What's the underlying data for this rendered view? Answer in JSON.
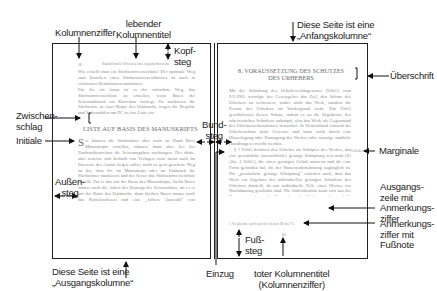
{
  "labels": {
    "kolumnenziffer": "Kolumnenziffer",
    "lebender_kolumnentitel": [
      "lebender",
      "Kolumnentitel"
    ],
    "kopfsteg": [
      "Kopf-",
      "steg"
    ],
    "anfangskolumne": [
      "Diese Seite ist eine",
      "„Anfangskolumne“"
    ],
    "ueberschrift": "Überschrift",
    "zwischenschlag": [
      "Zwischen-",
      "schlag"
    ],
    "initiale": "Initiale",
    "bundsteg": [
      "Bund-",
      "steg"
    ],
    "marginalie": "Marginale",
    "aussensteg": [
      "Außen-",
      "steg"
    ],
    "ausgangszeile": [
      "Ausgangs-",
      "zeile mit",
      "Anmerkungs-",
      "ziffer"
    ],
    "anmerkungsziffer": [
      "Anmerkungs-",
      "ziffer mit",
      "Fußnote"
    ],
    "fusssteg": [
      "Fuß-",
      "steg"
    ],
    "ausgangskolumne": [
      "Diese Seite ist eine",
      "„Ausgangskolumne“"
    ],
    "einzug": "Einzug",
    "toter_kolumnentitel": [
      "toter Kolumnentitel",
      "(Kolumnenziffer)"
    ]
  },
  "left_page": {
    "page_number": "56",
    "running_head": "Redaktionelle Hinweise und Aufgabenbereiche",
    "paragraph1": "Wie erstellt man ein Stichwortverzeichnis? Der optimale Weg zum Erstellen eines Stichwortverzeichnisses ist auch in erfahrenen Redaktionen umstritten.",
    "paragraph2": "Für Sie als Autor ist es der einfachste Weg, das Stichwortverzeichnis zu erstellen, wenn Ihnen der Seitenumbruch zur Korrektur vorliegt. Sie markieren die Stichworte in einer Kopie des Umbruchs, tragen die Begriffe und Seitenzahlen am PC in eine Liste ein.",
    "subheading": "LISTE AUF BASIS DES MANUSKRIPTS",
    "initial": "S",
    "paragraph3": "ie können die Stichwörter aber auch an Hand Ihres Manuskripts erstellen, müssen dann aber bei der Umbruchkorrektur die Seitenangaben nachtragen. Der dritte, aber teuerste und deshalb von Verlagen zwar meist auch im Interesse des Autors liegen sollte) nicht so gern gesehene Weg ist der, dass Sie im Manuskript oder im Umbruch die Stichwörter markieren und der Setzer das Stichwortverzeichnis erstellt. Tut er das auf der Basis des Manuskripts, bleibt Ihnen immer noch die Arbeit des Eintrags der Seitenzahlen, tut er es auf der Basis des Umbruchs, dann bleiben Ihnen immer noch das Korrekturlesen und eine „sichere Auswahl“ von Stichproben."
  },
  "right_page": {
    "heading": "8. VORAUSSETZUNG DES SCHUTZES DES URHEBERS",
    "paragraph1": "Mit der Schaffung des Urheberrechtsgesetzes (UrhG) vom 9.9.1965 verfolgte der Gesetzgeber das Ziel, den Schutz des Urhebers zu verbessern, wobei nicht das Werk, sondern die Person des Urhebers im Vordergrund steht. Das UrhG gewährleistet diesen Schutz, indem es an die Ergebnisse des urheberischen Schaffens anknüpft, also das Werk als Gegenstand des Urheberrechtsschutzes betrachtet. In Deutschland entsteht der Urheberschutz kraft Gesetzes und kann nicht durch eine Hinterlegung oder Eintragung des Werkes oder sonstige amtliche Handlungen erreicht werden.",
    "paragraph2": "§ 7 UrhG definiert den Urheber als Schöpfer des Werkes, das eine persönliche (menschliche) geistige Schöpfung sein muß (§2 Abs. 2 UrhG), die einen geistigen Gehalt aufweist und die eine Form gefunden hat, die der Sinneswahrnehmung zugänglich ist. Die „persönliche geistige Schöpfung“ erfordert auch, dass das Werk ein Ergebnis des individuellen geistigen Schaffens des Urhebers darstellt, da nur individuelle Teile eines Werkes vor Nachahmung geschützt sind. Die Individualität kann sich aus der Konzeption wie aus der Formgebung des Werkes ergeben und die eine Form gefunden hat.¹",
    "marginalie": "Urheber",
    "footnote": "1 Vergleiche auch auf den Seiten 68 bis 73.",
    "page_number": "83"
  },
  "colors": {
    "line": "#222222",
    "body_text": "#8a8a8a",
    "label_text": "#222222"
  }
}
